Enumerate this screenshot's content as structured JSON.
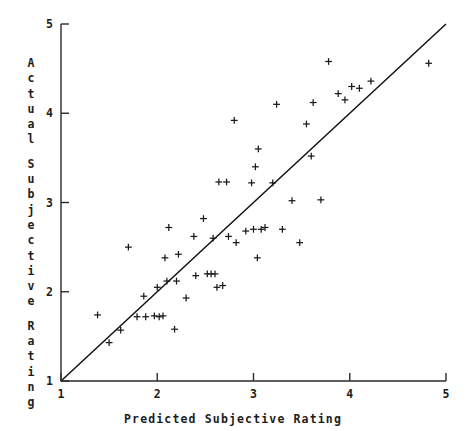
{
  "figure": {
    "name": "predicted-vs-actual-subjective-rating-scatterplot"
  },
  "axes": {
    "x": {
      "label": "Predicted Subjective Rating",
      "ticks": [
        "1",
        "2",
        "3",
        "4",
        "5"
      ],
      "min": 1,
      "max": 5
    },
    "y": {
      "label": "Actual Subjective Rating",
      "label_lines": [
        "Actual",
        "Subjective",
        "Rating"
      ],
      "ticks": [
        "1",
        "2",
        "3",
        "4",
        "5"
      ],
      "min": 1,
      "max": 5
    }
  },
  "style": {
    "axis_color": "#2b2b2b",
    "marker_color": "#1a1a1a",
    "line_color": "#111111",
    "background": "#ffffff",
    "marker_symbol": "plus"
  },
  "chart_data": {
    "type": "scatter",
    "title": "",
    "xlabel": "Predicted Subjective Rating",
    "ylabel": "Actual Subjective Rating",
    "xlim": [
      1,
      5
    ],
    "ylim": [
      1,
      5
    ],
    "grid": false,
    "legend": null,
    "marker": "+",
    "reference_line": {
      "name": "identity-line",
      "description": "y = x diagonal from (1,1) to (5,5)",
      "from": [
        1,
        1
      ],
      "to": [
        5,
        5
      ]
    },
    "series": [
      {
        "name": "observations",
        "points": [
          [
            1.38,
            1.74
          ],
          [
            1.5,
            1.43
          ],
          [
            1.62,
            1.57
          ],
          [
            1.7,
            2.5
          ],
          [
            1.79,
            1.72
          ],
          [
            1.86,
            1.95
          ],
          [
            1.88,
            1.72
          ],
          [
            1.97,
            1.73
          ],
          [
            2.0,
            2.05
          ],
          [
            2.02,
            1.72
          ],
          [
            2.06,
            1.73
          ],
          [
            2.08,
            2.38
          ],
          [
            2.1,
            2.12
          ],
          [
            2.12,
            2.72
          ],
          [
            2.18,
            1.58
          ],
          [
            2.2,
            2.12
          ],
          [
            2.22,
            2.42
          ],
          [
            2.3,
            1.93
          ],
          [
            2.38,
            2.62
          ],
          [
            2.4,
            2.18
          ],
          [
            2.48,
            2.82
          ],
          [
            2.52,
            2.2
          ],
          [
            2.56,
            2.2
          ],
          [
            2.6,
            2.2
          ],
          [
            2.58,
            2.6
          ],
          [
            2.62,
            2.05
          ],
          [
            2.64,
            3.23
          ],
          [
            2.68,
            2.07
          ],
          [
            2.72,
            3.23
          ],
          [
            2.74,
            2.62
          ],
          [
            2.8,
            3.92
          ],
          [
            2.82,
            2.55
          ],
          [
            2.92,
            2.68
          ],
          [
            2.98,
            3.22
          ],
          [
            3.0,
            2.7
          ],
          [
            3.02,
            3.4
          ],
          [
            3.04,
            2.38
          ],
          [
            3.05,
            3.6
          ],
          [
            3.08,
            2.7
          ],
          [
            3.12,
            2.72
          ],
          [
            3.2,
            3.22
          ],
          [
            3.24,
            4.1
          ],
          [
            3.3,
            2.7
          ],
          [
            3.4,
            3.02
          ],
          [
            3.48,
            2.55
          ],
          [
            3.55,
            3.88
          ],
          [
            3.6,
            3.52
          ],
          [
            3.62,
            4.12
          ],
          [
            3.7,
            3.03
          ],
          [
            3.78,
            4.58
          ],
          [
            3.88,
            4.22
          ],
          [
            3.95,
            4.15
          ],
          [
            4.02,
            4.3
          ],
          [
            4.1,
            4.28
          ],
          [
            4.22,
            4.36
          ],
          [
            4.82,
            4.56
          ]
        ]
      }
    ]
  }
}
